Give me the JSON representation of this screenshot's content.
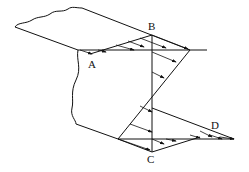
{
  "diagram": {
    "type": "shear-stress-distribution",
    "labels": {
      "A": "A",
      "B": "B",
      "C": "C",
      "D": "D"
    },
    "colors": {
      "stroke": "#111111",
      "background": "#ffffff"
    }
  }
}
